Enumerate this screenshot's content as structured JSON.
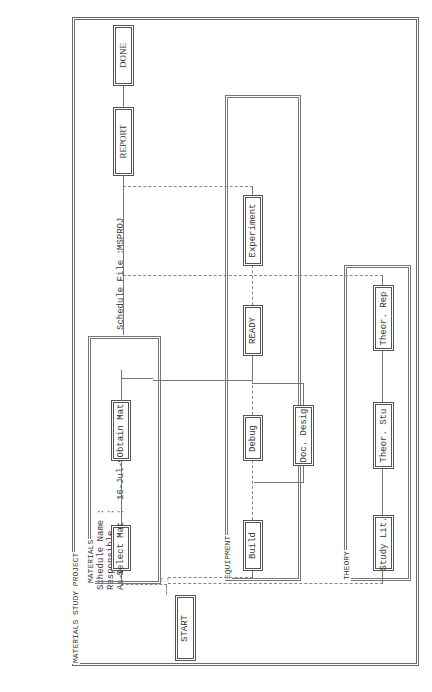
{
  "header": {
    "schedule_name_label": "Schedule Name :",
    "responsible_label": "Responsible   :",
    "as_of_date_label": "As-of Date    :",
    "as_of_date_value": "16-Jul-90  9:00a",
    "schedule_file_label": "Schedule File :",
    "schedule_file_value": "MSPROJ"
  },
  "project": {
    "title": "MATERIALS STUDY PROJECT"
  },
  "groups": [
    {
      "id": "materials",
      "label": "MATERIALS"
    },
    {
      "id": "equipment",
      "label": "EQUIPMENT"
    },
    {
      "id": "theory",
      "label": "THEORY"
    }
  ],
  "tasks": {
    "start": "START",
    "select_mat": "Select Mat",
    "obtain_mat": "Obtain Mat",
    "build": "Build",
    "debug": "Debug",
    "doc_desig": "Doc. Desig",
    "ready": "READY",
    "experiment": "Experiment",
    "study_lit": "Study Lit.",
    "theor_stu": "Theor. Stu",
    "theor_rep": "Theor. Rep",
    "report": "REPORT",
    "done": "DONE"
  },
  "dependencies": [
    [
      "START",
      "Select Mat"
    ],
    [
      "START",
      "Build"
    ],
    [
      "START",
      "Study Lit."
    ],
    [
      "Select Mat",
      "Obtain Mat"
    ],
    [
      "Build",
      "Debug"
    ],
    [
      "Build",
      "Doc. Desig"
    ],
    [
      "Debug",
      "READY"
    ],
    [
      "Doc. Desig",
      "READY"
    ],
    [
      "Obtain Mat",
      "READY"
    ],
    [
      "READY",
      "Experiment"
    ],
    [
      "Study Lit.",
      "Theor. Stu"
    ],
    [
      "Theor. Stu",
      "Theor. Rep"
    ],
    [
      "Theor. Rep",
      "REPORT"
    ],
    [
      "Experiment",
      "REPORT"
    ],
    [
      "REPORT",
      "DONE"
    ]
  ],
  "arrow_glyph": "→"
}
